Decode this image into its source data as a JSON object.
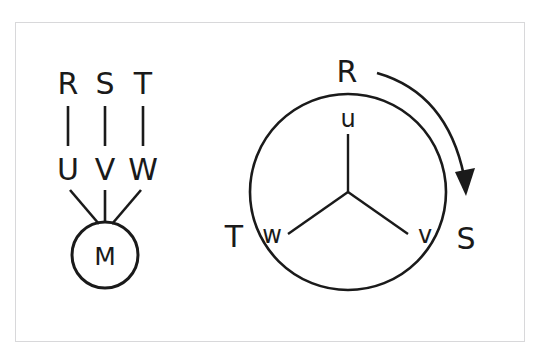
{
  "caption": {
    "text": "三相誘導電動機の回転方向と結線図"
  },
  "figure": {
    "stroke_color": "#1a1a1a",
    "frame_color": "#d8d8da",
    "background": "#ffffff"
  },
  "left_diagram": {
    "name": "terminal-wiring-diagram",
    "supply_terminals": [
      {
        "label": "R",
        "x": 68
      },
      {
        "label": "S",
        "x": 105
      },
      {
        "label": "T",
        "x": 143
      }
    ],
    "motor_terminals": [
      {
        "label": "U",
        "x": 68
      },
      {
        "label": "V",
        "x": 105
      },
      {
        "label": "W",
        "x": 143
      }
    ],
    "motor": {
      "label": "M",
      "cx": 105,
      "cy": 255,
      "r": 33
    }
  },
  "right_diagram": {
    "name": "rotation-phasor-diagram",
    "circle": {
      "cx": 348,
      "cy": 192,
      "r": 98
    },
    "inner_windings": [
      {
        "label": "u",
        "angle_deg": 90,
        "lx": 348,
        "ly": 127
      },
      {
        "label": "w",
        "angle_deg": 210,
        "lx": 272,
        "ly": 243
      },
      {
        "label": "v",
        "angle_deg": 330,
        "lx": 425,
        "ly": 243
      }
    ],
    "outer_phases": [
      {
        "label": "R",
        "lx": 347,
        "ly": 82
      },
      {
        "label": "S",
        "lx": 466,
        "ly": 249
      },
      {
        "label": "T",
        "lx": 234,
        "ly": 247
      }
    ],
    "rotation_arrow": {
      "name": "clockwise-rotation-arrow",
      "direction": "clockwise",
      "from_phase": "R",
      "to_phase": "S"
    }
  }
}
